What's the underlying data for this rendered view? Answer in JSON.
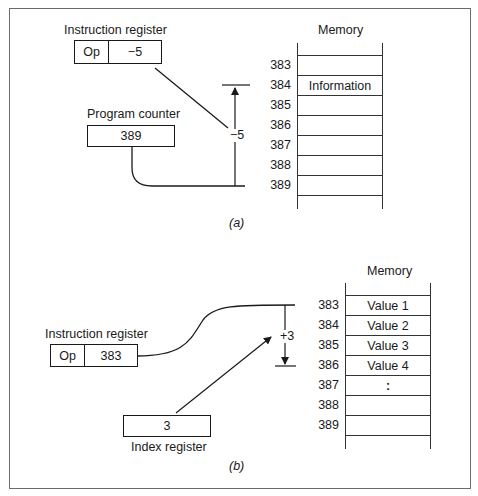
{
  "panel_a": {
    "instruction_register": {
      "label": "Instruction register",
      "op": "Op",
      "operand": "−5"
    },
    "program_counter": {
      "label": "Program counter",
      "value": "389"
    },
    "offset_label": "−5",
    "memory": {
      "title": "Memory",
      "rows": [
        {
          "address": "383",
          "content": ""
        },
        {
          "address": "384",
          "content": "Information"
        },
        {
          "address": "385",
          "content": ""
        },
        {
          "address": "386",
          "content": ""
        },
        {
          "address": "387",
          "content": ""
        },
        {
          "address": "388",
          "content": ""
        },
        {
          "address": "389",
          "content": ""
        }
      ]
    },
    "caption": "(a)"
  },
  "panel_b": {
    "instruction_register": {
      "label": "Instruction register",
      "op": "Op",
      "operand": "383"
    },
    "index_register": {
      "label": "Index register",
      "value": "3"
    },
    "offset_label": "+3",
    "memory": {
      "title": "Memory",
      "rows": [
        {
          "address": "383",
          "content": "Value 1"
        },
        {
          "address": "384",
          "content": "Value 2"
        },
        {
          "address": "385",
          "content": "Value 3"
        },
        {
          "address": "386",
          "content": "Value 4"
        },
        {
          "address": "387",
          "content": ":"
        },
        {
          "address": "388",
          "content": ""
        },
        {
          "address": "389",
          "content": ""
        }
      ]
    },
    "caption": "(b)"
  }
}
